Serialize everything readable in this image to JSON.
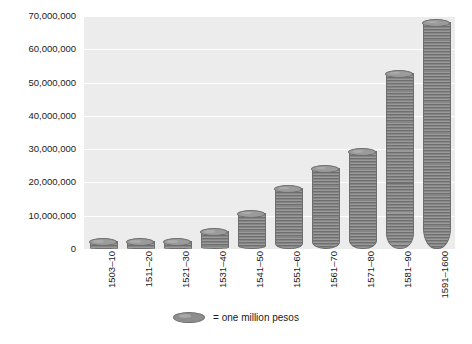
{
  "chart_data": {
    "type": "bar",
    "title": "",
    "subtitle": "",
    "xlabel": "",
    "ylabel": "",
    "categories": [
      "1503–10",
      "1511–20",
      "1521–30",
      "1531–40",
      "1541–50",
      "1551–60",
      "1561–70",
      "1571–80",
      "1581–90",
      "1591–1600"
    ],
    "values": [
      2000000,
      2000000,
      2000000,
      5000000,
      10500000,
      18000000,
      24000000,
      29000000,
      52500000,
      68000000
    ],
    "ylim": [
      0,
      70000000
    ],
    "ytick_values": [
      0,
      10000000,
      20000000,
      30000000,
      40000000,
      50000000,
      60000000,
      70000000
    ],
    "ytick_labels": [
      "0",
      "10,000,000",
      "20,000,000",
      "30,000,000",
      "40,000,000",
      "50,000,000",
      "60,000,000",
      "70,000,000"
    ],
    "grid": true,
    "legend_position": "bottom",
    "legend": [
      {
        "marker": "coin-ellipse",
        "label": "= one million pesos"
      }
    ],
    "unit_note": "= one million pesos",
    "colors": {
      "bar_fill": "#8d8d8d",
      "bar_stripe_dark": "#6f6f6f",
      "bar_edge": "#6e6e6e",
      "bar_top": "#9b9b9b",
      "plot_background": "#ececec",
      "gridline": "#ffffff",
      "page_background": "#ffffff",
      "text": "#1a1a1a"
    }
  }
}
